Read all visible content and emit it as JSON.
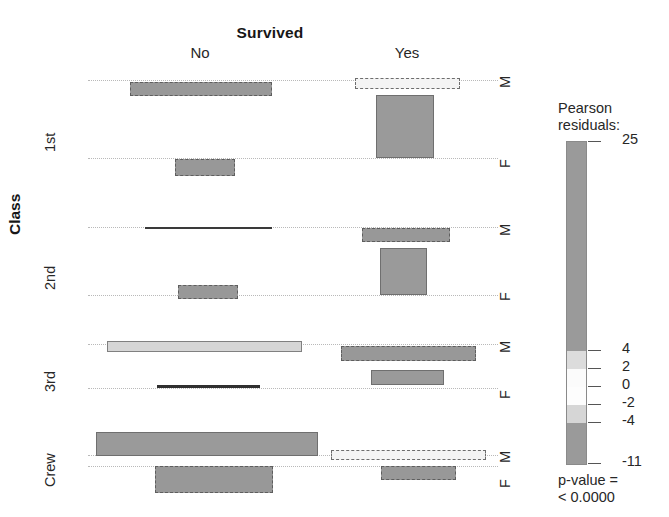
{
  "figure": {
    "type": "mosaic-plot",
    "top_title": "Survived",
    "x_axis_label": "Survived",
    "y_axis_label": "Class",
    "right_axis_label": "Sex",
    "column_labels": [
      "No",
      "Yes"
    ],
    "row_group_labels": [
      "1st",
      "2nd",
      "3rd",
      "Crew"
    ],
    "sex_labels": [
      "M",
      "F"
    ],
    "background_color": "#ffffff"
  },
  "legend": {
    "title_line1": "Pearson",
    "title_line2": "residuals:",
    "tick_labels": [
      "25",
      "4",
      "2",
      "0",
      "-2",
      "-4",
      "-11"
    ],
    "max": "25",
    "min": "-11",
    "pvalue_line1": "p-value =",
    "pvalue_line2": "< 0.0000",
    "colors": {
      "strong_positive": "#9a9a9a",
      "weak_positive": "#d8d8d8",
      "neutral": "#ffffff",
      "weak_negative": "#d0d0d0",
      "strong_negative": "#9a9a9a"
    },
    "segments": [
      {
        "name": "above-4",
        "label": "25 to 4",
        "color": "#9a9a9a",
        "frac": 0.648
      },
      {
        "name": "2-to-4",
        "label": "4 to 2",
        "color": "#dcdcdc",
        "frac": 0.056
      },
      {
        "name": "0-to-2",
        "label": "2 to 0",
        "color": "#fbfbfb",
        "frac": 0.056
      },
      {
        "name": "-2-to-0",
        "label": "0 to -2",
        "color": "#fdfdfd",
        "frac": 0.056
      },
      {
        "name": "-4-to--2",
        "label": "-2 to -4",
        "color": "#d6d6d6",
        "frac": 0.056
      },
      {
        "name": "below--4",
        "label": "-4 to -11",
        "color": "#9a9a9a",
        "frac": 0.128
      }
    ]
  },
  "chart_data": {
    "type": "mosaic",
    "title": "Survived",
    "xlabel": "Survived",
    "ylabel": "Class",
    "rightlabel": "Sex",
    "x_categories": [
      "No",
      "Yes"
    ],
    "y_categories": [
      "1st",
      "2nd",
      "3rd",
      "Crew"
    ],
    "split_categories": [
      "M",
      "F"
    ],
    "shading": "Pearson residuals",
    "residual_cuts": [
      -11,
      -4,
      -2,
      0,
      2,
      4,
      25
    ],
    "legend_position": "right",
    "grid": false,
    "cells": [
      {
        "class": "1st",
        "survived": "No",
        "sex": "M",
        "residual": -5.0,
        "shade": "dashed-dark",
        "x": 130,
        "y": 82,
        "w": 142,
        "h": 14
      },
      {
        "class": "1st",
        "survived": "No",
        "sex": "F",
        "residual": -5.0,
        "shade": "dashed-dark",
        "x": 175,
        "y": 159,
        "w": 60,
        "h": 17
      },
      {
        "class": "1st",
        "survived": "Yes",
        "sex": "M",
        "residual": 1.5,
        "shade": "dashed-light",
        "x": 355,
        "y": 78,
        "w": 105,
        "h": 11
      },
      {
        "class": "1st",
        "survived": "Yes",
        "sex": "F",
        "residual": 12.0,
        "shade": "solid-dark",
        "x": 376,
        "y": 95,
        "w": 58,
        "h": 63
      },
      {
        "class": "2nd",
        "survived": "No",
        "sex": "M",
        "residual": 0.5,
        "shade": "hairline",
        "x": 145,
        "y": 227,
        "w": 127,
        "h": 2
      },
      {
        "class": "2nd",
        "survived": "No",
        "sex": "F",
        "residual": -4.5,
        "shade": "dashed-dark",
        "x": 178,
        "y": 285,
        "w": 60,
        "h": 14
      },
      {
        "class": "2nd",
        "survived": "Yes",
        "sex": "M",
        "residual": -4.5,
        "shade": "dashed-dark",
        "x": 362,
        "y": 228,
        "w": 88,
        "h": 14
      },
      {
        "class": "2nd",
        "survived": "Yes",
        "sex": "F",
        "residual": 13.0,
        "shade": "solid-dark",
        "x": 380,
        "y": 248,
        "w": 47,
        "h": 47
      },
      {
        "class": "3rd",
        "survived": "No",
        "sex": "M",
        "residual": 2.5,
        "shade": "solid-light",
        "x": 107,
        "y": 341,
        "w": 195,
        "h": 11
      },
      {
        "class": "3rd",
        "survived": "No",
        "sex": "F",
        "residual": -0.5,
        "shade": "hairline-d",
        "x": 157,
        "y": 385,
        "w": 103,
        "h": 3
      },
      {
        "class": "3rd",
        "survived": "Yes",
        "sex": "M",
        "residual": -4.5,
        "shade": "dashed-dark",
        "x": 341,
        "y": 346,
        "w": 135,
        "h": 15
      },
      {
        "class": "3rd",
        "survived": "Yes",
        "sex": "F",
        "residual": -3.0,
        "shade": "solid-dark",
        "x": 371,
        "y": 370,
        "w": 73,
        "h": 15
      },
      {
        "class": "Crew",
        "survived": "No",
        "sex": "M",
        "residual": 6.0,
        "shade": "solid-dark",
        "x": 96,
        "y": 432,
        "w": 222,
        "h": 24
      },
      {
        "class": "Crew",
        "survived": "No",
        "sex": "F",
        "residual": -5.0,
        "shade": "dashed-dark",
        "x": 155,
        "y": 466,
        "w": 118,
        "h": 27
      },
      {
        "class": "Crew",
        "survived": "Yes",
        "sex": "M",
        "residual": 1.0,
        "shade": "dashed-light",
        "x": 331,
        "y": 450,
        "w": 155,
        "h": 10
      },
      {
        "class": "Crew",
        "survived": "Yes",
        "sex": "F",
        "residual": -4.5,
        "shade": "dashed-dark",
        "x": 381,
        "y": 466,
        "w": 75,
        "h": 14
      }
    ],
    "baselines": [
      {
        "name": "r1-m",
        "x": 88,
        "y": 80,
        "w": 410
      },
      {
        "name": "r1-f",
        "x": 88,
        "y": 158,
        "w": 410
      },
      {
        "name": "r2-m",
        "x": 88,
        "y": 227,
        "w": 410
      },
      {
        "name": "r2-f",
        "x": 88,
        "y": 295,
        "w": 410
      },
      {
        "name": "r3-m",
        "x": 88,
        "y": 344,
        "w": 410
      },
      {
        "name": "r3-f",
        "x": 88,
        "y": 388,
        "w": 410
      },
      {
        "name": "r4-m",
        "x": 88,
        "y": 455,
        "w": 410
      },
      {
        "name": "r4-f",
        "x": 88,
        "y": 466,
        "w": 410
      }
    ],
    "column_label_positions": [
      {
        "label": "No",
        "cx": 200
      },
      {
        "label": "Yes",
        "cx": 407
      }
    ],
    "class_label_positions": [
      {
        "label": "1st",
        "cy": 130
      },
      {
        "label": "2nd",
        "cy": 268
      },
      {
        "label": "3rd",
        "cy": 370
      },
      {
        "label": "Crew",
        "cy": 465
      }
    ],
    "sex_label_positions": [
      {
        "label": "M",
        "cy": 80
      },
      {
        "label": "F",
        "cy": 160
      },
      {
        "label": "M",
        "cy": 228
      },
      {
        "label": "F",
        "cy": 293
      },
      {
        "label": "M",
        "cy": 345
      },
      {
        "label": "F",
        "cy": 391
      },
      {
        "label": "M",
        "cy": 455
      },
      {
        "label": "F",
        "cy": 480
      }
    ]
  }
}
